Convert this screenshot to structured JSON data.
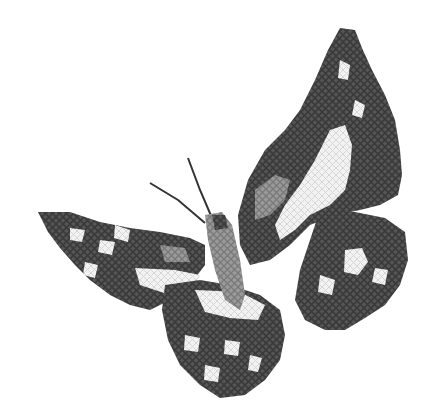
{
  "image": {
    "subject": "cross-stitch butterfly",
    "style": "grayscale",
    "colors": {
      "background": "#ffffff",
      "dark": "#4a4a4a",
      "mid": "#8a8a8a",
      "light": "#e8e8e8",
      "antenna": "#333333"
    }
  }
}
